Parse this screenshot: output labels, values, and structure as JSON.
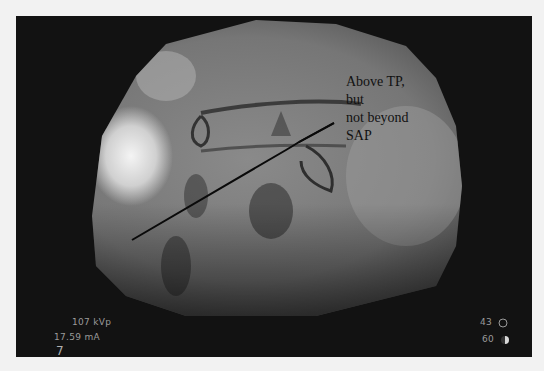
{
  "image": {
    "type": "fluoroscopy",
    "description": "Lateral fluoroscopic spine image with needle trajectory line",
    "background_color": "#121212",
    "page_color": "#f2f2f2"
  },
  "annotation": {
    "lines": [
      "Above TP,",
      "but",
      "not beyond",
      "SAP"
    ]
  },
  "overlay": {
    "kvp_value": "107",
    "kvp_unit": "kVp",
    "ma_value": "17.59",
    "ma_unit": "mA",
    "frame_number": "7",
    "right_top_value": "43",
    "right_top_icon": "circle-outline-icon",
    "right_bottom_value": "60",
    "right_bottom_icon": "half-moon-icon"
  }
}
